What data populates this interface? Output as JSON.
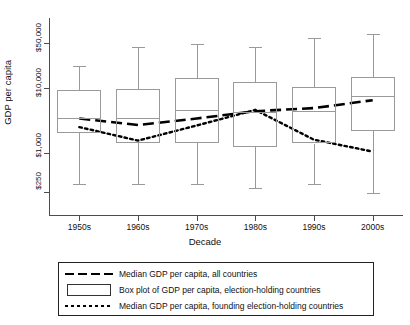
{
  "chart_data": {
    "type": "line",
    "title": "",
    "xlabel": "Decade",
    "ylabel": "GDP per capita",
    "categories": [
      "1950s",
      "1960s",
      "1970s",
      "1980s",
      "1990s",
      "2000s"
    ],
    "y_scale": "log",
    "ylim": [
      250,
      90000
    ],
    "yticks": [
      250,
      1000,
      10000,
      50000
    ],
    "ytick_labels": [
      "$250",
      "$1,000",
      "$10,000",
      "$50,000"
    ],
    "grid": false,
    "legend_position": "below",
    "series": [
      {
        "name": "Median GDP per capita, all countries",
        "style": "dashed",
        "values": [
          3400,
          2700,
          3400,
          4400,
          4900,
          6500
        ]
      },
      {
        "name": "Median GDP per capita, founding election-holding countries",
        "style": "dotted",
        "values": [
          2500,
          1550,
          2650,
          4600,
          1600,
          1050
        ]
      }
    ],
    "boxplot": {
      "name": "Box plot of GDP per capita, election-holding countries",
      "categories": [
        "1950s",
        "1960s",
        "1970s",
        "1980s",
        "1990s",
        "2000s"
      ],
      "boxes": [
        {
          "decade": "1950s",
          "whisker_low": 330,
          "q1": 2000,
          "median": 3500,
          "q3": 9200,
          "whisker_high": 22000
        },
        {
          "decade": "1960s",
          "whisker_low": 330,
          "q1": 1450,
          "median": 3500,
          "q3": 9800,
          "whisker_high": 42000
        },
        {
          "decade": "1970s",
          "whisker_low": 330,
          "q1": 1450,
          "median": 4600,
          "q3": 14500,
          "whisker_high": 47000
        },
        {
          "decade": "1980s",
          "whisker_low": 290,
          "q1": 1250,
          "median": 4300,
          "q3": 12500,
          "whisker_high": 42000
        },
        {
          "decade": "1990s",
          "whisker_low": 330,
          "q1": 1400,
          "median": 4400,
          "q3": 10500,
          "whisker_high": 58000
        },
        {
          "decade": "2000s",
          "whisker_low": 240,
          "q1": 2150,
          "median": 7500,
          "q3": 15000,
          "whisker_high": 68000
        }
      ]
    }
  },
  "legend": {
    "items": [
      {
        "key": "dashed-line",
        "label": "Median GDP per capita, all countries"
      },
      {
        "key": "box-rect",
        "label": "Box plot of GDP per capita, election-holding countries"
      },
      {
        "key": "dotted-line",
        "label": "Median GDP per capita, founding election-holding countries"
      }
    ]
  }
}
